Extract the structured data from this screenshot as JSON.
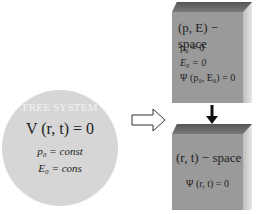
{
  "circle": {
    "title": "FREE SYSTEM",
    "equation": "V (r, t) = 0",
    "line1": "p₀ = const",
    "line2": "E₀ = cons",
    "color": "#d6d6d6"
  },
  "box_pE": {
    "heading": "(p, E) − space",
    "lines": [
      "p₀ = 0",
      "E₀ = 0",
      "Ψ (p₀, E₀) = 0"
    ]
  },
  "box_rt": {
    "heading": "(r, t) − space",
    "lines": [
      "Ψ (r, t) = 0"
    ]
  },
  "arrows": {
    "right": "hollow-right-arrow",
    "down": "solid-down-arrow"
  }
}
